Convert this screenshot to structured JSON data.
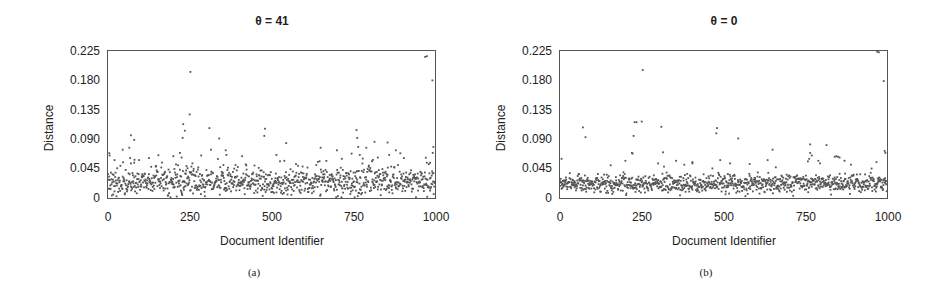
{
  "chart_data": [
    {
      "id": "a",
      "type": "scatter",
      "title": "θ = 41",
      "caption": "(a)",
      "xlabel": "Document Identifier",
      "ylabel": "Distance",
      "xlim": [
        0,
        1000
      ],
      "ylim": [
        0,
        0.225
      ],
      "xticks": [
        "0",
        "250",
        "500",
        "750",
        "1000"
      ],
      "yticks": [
        "0",
        "0.045",
        "0.090",
        "0.135",
        "0.180",
        "0.225"
      ],
      "grid": false,
      "legend": null,
      "point_color": "#555555",
      "baseline": {
        "count": 1000,
        "seed": 41,
        "mean": 0.024,
        "spread": 0.014,
        "tail": 0.028,
        "tail_prob": 0.12
      },
      "outliers": [
        {
          "x": 5,
          "y": 0.065
        },
        {
          "x": 20,
          "y": 0.058
        },
        {
          "x": 45,
          "y": 0.074
        },
        {
          "x": 65,
          "y": 0.077
        },
        {
          "x": 70,
          "y": 0.096
        },
        {
          "x": 80,
          "y": 0.089
        },
        {
          "x": 70,
          "y": 0.053
        },
        {
          "x": 80,
          "y": 0.054
        },
        {
          "x": 125,
          "y": 0.061
        },
        {
          "x": 200,
          "y": 0.064
        },
        {
          "x": 220,
          "y": 0.069
        },
        {
          "x": 225,
          "y": 0.062
        },
        {
          "x": 228,
          "y": 0.092
        },
        {
          "x": 230,
          "y": 0.113
        },
        {
          "x": 235,
          "y": 0.103
        },
        {
          "x": 250,
          "y": 0.128
        },
        {
          "x": 252,
          "y": 0.193
        },
        {
          "x": 285,
          "y": 0.065
        },
        {
          "x": 310,
          "y": 0.107
        },
        {
          "x": 315,
          "y": 0.074
        },
        {
          "x": 340,
          "y": 0.091
        },
        {
          "x": 360,
          "y": 0.073
        },
        {
          "x": 362,
          "y": 0.066
        },
        {
          "x": 410,
          "y": 0.064
        },
        {
          "x": 480,
          "y": 0.106
        },
        {
          "x": 478,
          "y": 0.095
        },
        {
          "x": 515,
          "y": 0.066
        },
        {
          "x": 545,
          "y": 0.084
        },
        {
          "x": 650,
          "y": 0.077
        },
        {
          "x": 700,
          "y": 0.073
        },
        {
          "x": 715,
          "y": 0.06
        },
        {
          "x": 745,
          "y": 0.068
        },
        {
          "x": 760,
          "y": 0.104
        },
        {
          "x": 762,
          "y": 0.092
        },
        {
          "x": 765,
          "y": 0.078
        },
        {
          "x": 770,
          "y": 0.066
        },
        {
          "x": 790,
          "y": 0.077
        },
        {
          "x": 815,
          "y": 0.086
        },
        {
          "x": 825,
          "y": 0.062
        },
        {
          "x": 855,
          "y": 0.085
        },
        {
          "x": 860,
          "y": 0.066
        },
        {
          "x": 880,
          "y": 0.073
        },
        {
          "x": 905,
          "y": 0.061
        },
        {
          "x": 970,
          "y": 0.216
        },
        {
          "x": 975,
          "y": 0.217
        },
        {
          "x": 992,
          "y": 0.18
        },
        {
          "x": 995,
          "y": 0.078
        },
        {
          "x": 993,
          "y": 0.069
        },
        {
          "x": 975,
          "y": 0.054
        },
        {
          "x": 985,
          "y": 0.054
        }
      ]
    },
    {
      "id": "b",
      "type": "scatter",
      "title": "θ = 0",
      "caption": "(b)",
      "xlabel": "Document Identifier",
      "ylabel": "Distance",
      "xlim": [
        0,
        1000
      ],
      "ylim": [
        0,
        0.225
      ],
      "xticks": [
        "0",
        "250",
        "500",
        "750",
        "1000"
      ],
      "yticks": [
        "0",
        "0.045",
        "0.090",
        "0.135",
        "0.180",
        "0.225"
      ],
      "grid": false,
      "legend": null,
      "point_color": "#555555",
      "baseline": {
        "count": 1000,
        "seed": 7,
        "mean": 0.022,
        "spread": 0.01,
        "tail": 0.01,
        "tail_prob": 0.05
      },
      "outliers": [
        {
          "x": 5,
          "y": 0.06
        },
        {
          "x": 70,
          "y": 0.108
        },
        {
          "x": 78,
          "y": 0.093
        },
        {
          "x": 155,
          "y": 0.05
        },
        {
          "x": 200,
          "y": 0.057
        },
        {
          "x": 220,
          "y": 0.069
        },
        {
          "x": 222,
          "y": 0.068
        },
        {
          "x": 225,
          "y": 0.095
        },
        {
          "x": 228,
          "y": 0.116
        },
        {
          "x": 234,
          "y": 0.116
        },
        {
          "x": 250,
          "y": 0.117
        },
        {
          "x": 253,
          "y": 0.196
        },
        {
          "x": 300,
          "y": 0.053
        },
        {
          "x": 310,
          "y": 0.109
        },
        {
          "x": 315,
          "y": 0.07
        },
        {
          "x": 318,
          "y": 0.048
        },
        {
          "x": 355,
          "y": 0.057
        },
        {
          "x": 380,
          "y": 0.051
        },
        {
          "x": 405,
          "y": 0.055
        },
        {
          "x": 405,
          "y": 0.053
        },
        {
          "x": 480,
          "y": 0.107
        },
        {
          "x": 478,
          "y": 0.099
        },
        {
          "x": 490,
          "y": 0.058
        },
        {
          "x": 520,
          "y": 0.053
        },
        {
          "x": 545,
          "y": 0.091
        },
        {
          "x": 580,
          "y": 0.052
        },
        {
          "x": 635,
          "y": 0.058
        },
        {
          "x": 650,
          "y": 0.074
        },
        {
          "x": 660,
          "y": 0.047
        },
        {
          "x": 765,
          "y": 0.082
        },
        {
          "x": 765,
          "y": 0.069
        },
        {
          "x": 770,
          "y": 0.065
        },
        {
          "x": 762,
          "y": 0.06
        },
        {
          "x": 758,
          "y": 0.056
        },
        {
          "x": 790,
          "y": 0.057
        },
        {
          "x": 795,
          "y": 0.053
        },
        {
          "x": 815,
          "y": 0.081
        },
        {
          "x": 840,
          "y": 0.063
        },
        {
          "x": 845,
          "y": 0.064
        },
        {
          "x": 850,
          "y": 0.063
        },
        {
          "x": 855,
          "y": 0.062
        },
        {
          "x": 870,
          "y": 0.057
        },
        {
          "x": 890,
          "y": 0.051
        },
        {
          "x": 968,
          "y": 0.055
        },
        {
          "x": 970,
          "y": 0.224
        },
        {
          "x": 975,
          "y": 0.223
        },
        {
          "x": 990,
          "y": 0.179
        },
        {
          "x": 993,
          "y": 0.072
        },
        {
          "x": 995,
          "y": 0.069
        }
      ]
    }
  ]
}
